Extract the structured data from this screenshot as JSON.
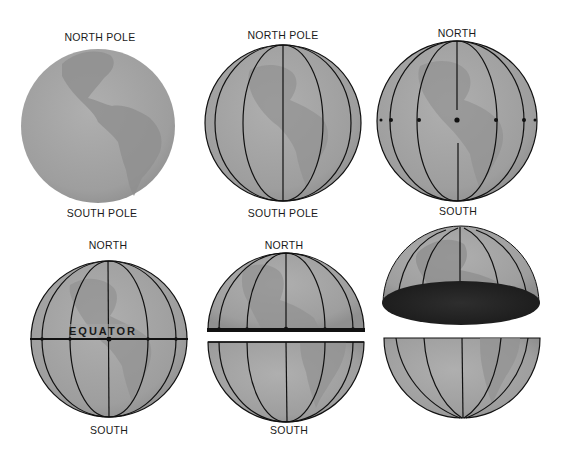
{
  "panels": [
    {
      "id": "globe-plain",
      "top_label": "NORTH POLE",
      "bottom_label": "SOUTH POLE"
    },
    {
      "id": "globe-meridians",
      "top_label": "NORTH POLE",
      "bottom_label": "SOUTH POLE"
    },
    {
      "id": "globe-equator-points",
      "top_label": "NORTH",
      "bottom_label": "SOUTH"
    },
    {
      "id": "globe-equator",
      "top_label": "NORTH",
      "middle_label": "EQUATOR",
      "bottom_label": "SOUTH"
    },
    {
      "id": "globe-split",
      "top_label": "NORTH",
      "bottom_label": "SOUTH"
    },
    {
      "id": "globe-hemispheres-separated"
    }
  ],
  "colors": {
    "globe_fill": "#a3a3a3",
    "land": "#8c8c8c",
    "line": "#111111",
    "cut_face": "#2a2a2a",
    "background": "#ffffff"
  }
}
